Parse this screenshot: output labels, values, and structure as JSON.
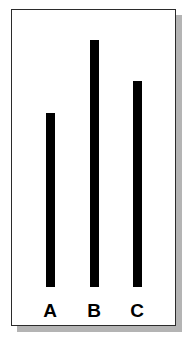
{
  "figure": {
    "title": "",
    "background_color": "#ffffff",
    "frame_color": "#2b2b2b",
    "shadow_color": "#b4b4b4",
    "bar_color": "#000000",
    "label_color": "#000000"
  },
  "chart_data": {
    "type": "bar",
    "title": "",
    "subtitle": "",
    "xlabel": "",
    "ylabel": "",
    "categories": [
      "A",
      "B",
      "C"
    ],
    "values": [
      174,
      247,
      206
    ],
    "ylim": [
      0,
      270
    ],
    "grid": false,
    "legend": null,
    "axis_ticks": {
      "x": [
        "A",
        "B",
        "C"
      ],
      "y": []
    },
    "annotations": []
  },
  "bars": [
    {
      "label": "A",
      "value": 174,
      "left_px": 34,
      "width_px": 9,
      "height_px": 174,
      "label_left_px": 27,
      "label_width_px": 22
    },
    {
      "label": "B",
      "value": 247,
      "left_px": 78,
      "width_px": 9,
      "height_px": 247,
      "label_left_px": 71,
      "label_width_px": 22
    },
    {
      "label": "C",
      "value": 206,
      "left_px": 121,
      "width_px": 9,
      "height_px": 206,
      "label_left_px": 114,
      "label_width_px": 22
    }
  ]
}
